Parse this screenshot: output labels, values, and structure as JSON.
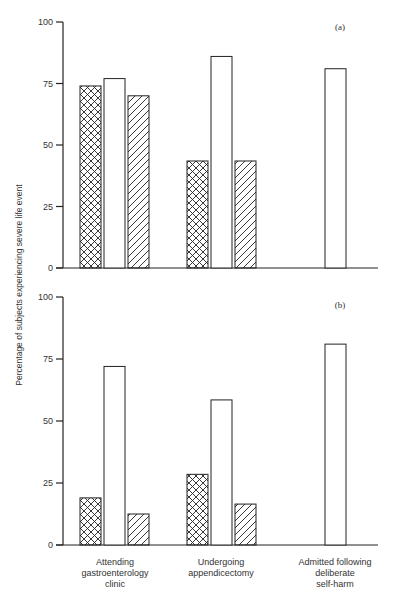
{
  "chart_data": [
    {
      "type": "bar",
      "panel": "(a)",
      "title": "",
      "xlabel": "",
      "ylabel": "Percentage of subjects experiencing severe life event",
      "ylim": [
        0,
        100
      ],
      "yticks": [
        0,
        25,
        50,
        75,
        100
      ],
      "grid": false,
      "legend": null,
      "categories": [
        "Attending gastroenterology clinic",
        "Undergoing appendicectomy",
        "Admitted following deliberate self-harm"
      ],
      "series": [
        {
          "name": "crosshatched",
          "pattern": "crosshatch",
          "values": [
            74,
            43.5,
            null
          ]
        },
        {
          "name": "open",
          "pattern": "none",
          "values": [
            77,
            86,
            81
          ]
        },
        {
          "name": "hatched",
          "pattern": "diagonal",
          "values": [
            70,
            43.5,
            null
          ]
        }
      ]
    },
    {
      "type": "bar",
      "panel": "(b)",
      "title": "",
      "xlabel": "",
      "ylabel": "Percentage of subjects experiencing severe life event",
      "ylim": [
        0,
        100
      ],
      "yticks": [
        0,
        25,
        50,
        75,
        100
      ],
      "grid": false,
      "legend": null,
      "categories": [
        "Attending gastroenterology clinic",
        "Undergoing appendicectomy",
        "Admitted following deliberate self-harm"
      ],
      "series": [
        {
          "name": "crosshatched",
          "pattern": "crosshatch",
          "values": [
            19,
            28.5,
            null
          ]
        },
        {
          "name": "open",
          "pattern": "none",
          "values": [
            72,
            58.5,
            81
          ]
        },
        {
          "name": "hatched",
          "pattern": "diagonal",
          "values": [
            12.5,
            16.5,
            null
          ]
        }
      ]
    }
  ],
  "labels": {
    "panel_a": "(a)",
    "panel_b": "(b)",
    "ylabel": "Percentage of subjects experiencing severe life event",
    "yticks": [
      "0",
      "25",
      "50",
      "75",
      "100"
    ],
    "categories": [
      "Attending\ngastroenterology\nclinic",
      "Undergoing\nappendicectomy",
      "Admitted following\ndeliberate\nself-harm"
    ]
  },
  "colors": {
    "axis": "#222222",
    "bar_stroke": "#222222",
    "bar_fill": "#ffffff",
    "background": "#ffffff"
  }
}
